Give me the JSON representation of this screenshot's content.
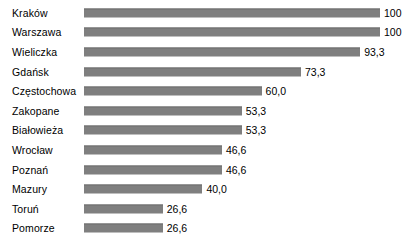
{
  "chart_data": {
    "type": "bar",
    "orientation": "horizontal",
    "title": "",
    "subtitle": "",
    "xlabel": "",
    "ylabel": "",
    "xlim": [
      0,
      100
    ],
    "grid": false,
    "legend": false,
    "legend_position": "none",
    "bar_color": "#7f7f7f",
    "label_color": "#000000",
    "background": "#ffffff",
    "decimal_separator": ",",
    "categories": [
      "Kraków",
      "Warszawa",
      "Wieliczka",
      "Gdańsk",
      "Częstochowa",
      "Zakopane",
      "Białowieża",
      "Wrocław",
      "Poznań",
      "Mazury",
      "Toruń",
      "Pomorze"
    ],
    "values": [
      100,
      100,
      93.3,
      73.3,
      60.0,
      53.3,
      53.3,
      46.6,
      46.6,
      40.0,
      26.6,
      26.6
    ],
    "value_labels": [
      "100",
      "100",
      "93,3",
      "73,3",
      "60,0",
      "53,3",
      "53,3",
      "46,6",
      "46,6",
      "40,0",
      "26,6",
      "26,6"
    ]
  }
}
